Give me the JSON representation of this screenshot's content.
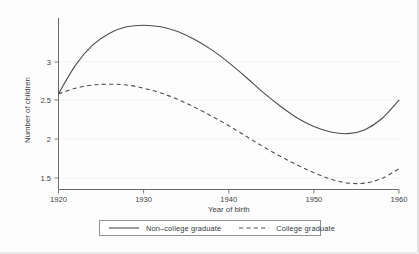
{
  "chart_data": {
    "type": "line",
    "title": "",
    "xlabel": "Year of birth",
    "ylabel": "Number of children",
    "xlim": [
      1920,
      1960
    ],
    "ylim": [
      1.37,
      3.52
    ],
    "xticks": [
      1920,
      1930,
      1940,
      1950,
      1960
    ],
    "xticklabels": [
      "1920",
      "1930",
      "1940",
      "1950",
      "1960"
    ],
    "yticks": [
      1.5,
      2,
      2.5,
      3
    ],
    "yticklabels": [
      "1.5",
      "2",
      "2.5",
      "3"
    ],
    "grid": "horizontal-faint",
    "legend_position": "below-axes",
    "x": [
      1920,
      1922,
      1924,
      1926,
      1928,
      1930,
      1932,
      1934,
      1936,
      1938,
      1940,
      1942,
      1944,
      1946,
      1948,
      1950,
      1952,
      1954,
      1956,
      1958,
      1960
    ],
    "series": [
      {
        "name": "Non-college graduate",
        "style": "solid",
        "color": "#4a4f52",
        "values": [
          2.57,
          2.93,
          3.18,
          3.33,
          3.41,
          3.43,
          3.41,
          3.35,
          3.25,
          3.12,
          2.96,
          2.78,
          2.59,
          2.42,
          2.27,
          2.16,
          2.09,
          2.07,
          2.12,
          2.26,
          2.49
        ]
      },
      {
        "name": "College graduate",
        "style": "dashed",
        "color": "#4a4f52",
        "values": [
          2.57,
          2.64,
          2.68,
          2.69,
          2.68,
          2.64,
          2.58,
          2.5,
          2.4,
          2.29,
          2.17,
          2.04,
          1.91,
          1.79,
          1.68,
          1.58,
          1.5,
          1.45,
          1.45,
          1.51,
          1.63
        ]
      }
    ],
    "annotations": {
      "solid_peak": {
        "x": 1930,
        "y": 3.43
      },
      "solid_min": {
        "x": 1953,
        "y": 2.07
      },
      "dashed_peak": {
        "x": 1925.5,
        "y": 2.69
      },
      "dashed_min": {
        "x": 1954.5,
        "y": 1.45
      },
      "shared_start": {
        "x": 1920,
        "y": 2.57
      }
    }
  },
  "legend": {
    "items": [
      {
        "label": "Non–college graduate",
        "style": "solid"
      },
      {
        "label": "College graduate",
        "style": "dashed"
      }
    ]
  }
}
